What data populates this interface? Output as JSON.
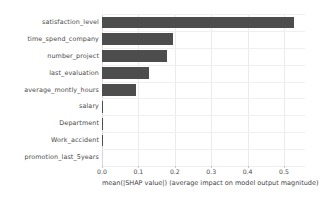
{
  "chart_data": {
    "type": "bar",
    "orientation": "horizontal",
    "title": "",
    "xlabel": "mean(|SHAP value|) (average impact on model output magnitude)",
    "ylabel": "",
    "xlim": [
      0.0,
      0.5577
    ],
    "grid": true,
    "legend": false,
    "bar_color": "#4d4d4d",
    "grid_color": "#eceaea",
    "background_color": "#ffffff",
    "xticks": [
      "0.0",
      "0.1",
      "0.2",
      "0.3",
      "0.4",
      "0.5"
    ],
    "xtick_values": [
      0.0,
      0.1,
      0.2,
      0.3,
      0.4,
      0.5
    ],
    "categories": [
      "satisfaction_level",
      "time_spend_company",
      "number_project",
      "last_evaluation",
      "average_montly_hours",
      "salary",
      "Department",
      "Work_accident",
      "promotion_last_5years"
    ],
    "values": [
      0.527,
      0.195,
      0.178,
      0.13,
      0.093,
      0.004,
      0.002,
      0.001,
      0.0
    ]
  }
}
